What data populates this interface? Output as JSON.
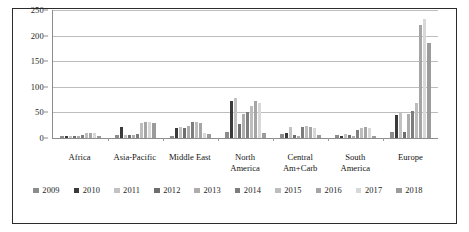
{
  "chart_data": {
    "type": "bar",
    "title": "",
    "subtitle": "",
    "xlabel": "",
    "ylabel": "",
    "ylim": [
      0,
      250
    ],
    "yticks": [
      0,
      50,
      100,
      150,
      200,
      250
    ],
    "grid": true,
    "legend_position": "bottom",
    "categories": [
      "Africa",
      "Asia-Pacific",
      "Middle East",
      "North America",
      "Central Am+Carb",
      "South America",
      "Europe"
    ],
    "category_lines": [
      [
        "Africa"
      ],
      [
        "Asia-Pacific"
      ],
      [
        "Middle East"
      ],
      [
        "North",
        "America"
      ],
      [
        "Central",
        "Am+Carb"
      ],
      [
        "South",
        "America"
      ],
      [
        "Europe"
      ]
    ],
    "series": [
      {
        "name": "2009",
        "color": "#8c8c8c",
        "values": [
          4,
          5,
          4,
          11,
          8,
          5,
          12
        ]
      },
      {
        "name": "2010",
        "color": "#3a3a3a",
        "values": [
          3,
          22,
          20,
          72,
          10,
          4,
          45
        ]
      },
      {
        "name": "2011",
        "color": "#c2c2c2",
        "values": [
          3,
          6,
          21,
          78,
          21,
          8,
          48
        ]
      },
      {
        "name": "2012",
        "color": "#6e6e6e",
        "values": [
          4,
          5,
          20,
          27,
          6,
          5,
          12
        ]
      },
      {
        "name": "2013",
        "color": "#adadad",
        "values": [
          4,
          5,
          24,
          46,
          4,
          4,
          47
        ]
      },
      {
        "name": "2014",
        "color": "#7d7d7d",
        "values": [
          6,
          8,
          31,
          50,
          22,
          16,
          52
        ]
      },
      {
        "name": "2015",
        "color": "#bdbdbd",
        "values": [
          9,
          30,
          32,
          62,
          24,
          20,
          68
        ]
      },
      {
        "name": "2016",
        "color": "#a5a5a5",
        "values": [
          10,
          32,
          30,
          72,
          22,
          21,
          220
        ]
      },
      {
        "name": "2017",
        "color": "#d8d8d8",
        "values": [
          9,
          31,
          9,
          69,
          19,
          19,
          233
        ]
      },
      {
        "name": "2018",
        "color": "#9b9b9b",
        "values": [
          4,
          30,
          7,
          10,
          6,
          4,
          185
        ]
      }
    ]
  }
}
